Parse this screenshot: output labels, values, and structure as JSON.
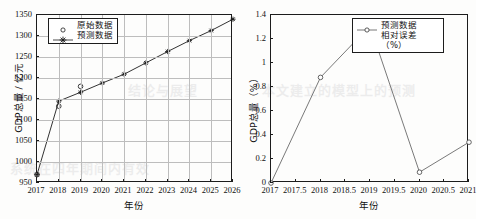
{
  "watermark": {
    "lines": [
      "结论与展望",
      "本文建立的模型上的预测",
      "系统在四年期间内有效"
    ]
  },
  "figures": [
    {
      "id": "gdp-forecast",
      "chart_data": {
        "type": "line",
        "title": "",
        "xlabel": "年份",
        "ylabel": "GDP总量 / 亿元",
        "xlim": [
          2017,
          2026
        ],
        "ylim": [
          950,
          1350
        ],
        "x_ticks": [
          "2017",
          "2018",
          "2019",
          "2020",
          "2021",
          "2022",
          "2023",
          "2024",
          "2025",
          "2026"
        ],
        "y_ticks": [
          "950",
          "1000",
          "1050",
          "1100",
          "1150",
          "1200",
          "1250",
          "1300",
          "1350"
        ],
        "grid": true,
        "legend_position": "upper-left",
        "series": [
          {
            "name": "原始数据",
            "marker": "open-circle",
            "line": false,
            "x": [
              2017,
              2018,
              2019
            ],
            "values": [
              970,
              1133,
              1180
            ]
          },
          {
            "name": "预测数据",
            "marker": "star",
            "line": true,
            "x": [
              2017,
              2018,
              2019,
              2020,
              2021,
              2022,
              2023,
              2024,
              2025,
              2026
            ],
            "values": [
              970,
              1145,
              1166,
              1188,
              1209,
              1236,
              1263,
              1289,
              1313,
              1340
            ]
          }
        ]
      }
    },
    {
      "id": "relative-error",
      "chart_data": {
        "type": "line",
        "title": "",
        "xlabel": "年份",
        "ylabel": "GDP总量（%）",
        "xlim": [
          2017,
          2021
        ],
        "ylim": [
          0,
          1.4
        ],
        "x_ticks": [
          "2017",
          "2017.5",
          "2018",
          "2018.5",
          "2019",
          "2019.5",
          "2020",
          "2020.5",
          "2021"
        ],
        "y_ticks": [
          "0",
          "0.2",
          "0.4",
          "0.6",
          "0.8",
          "1",
          "1.2",
          "1.4"
        ],
        "grid": false,
        "legend_position": "upper-right",
        "legend_lines": [
          "预测数据",
          "相对误差",
          "（%）"
        ],
        "series": [
          {
            "name": "预测数据相对误差（%）",
            "marker": "open-circle",
            "line": true,
            "x": [
              2017,
              2018,
              2019,
              2020,
              2021
            ],
            "values": [
              0,
              0.88,
              1.31,
              0.09,
              0.34
            ]
          }
        ]
      }
    }
  ]
}
